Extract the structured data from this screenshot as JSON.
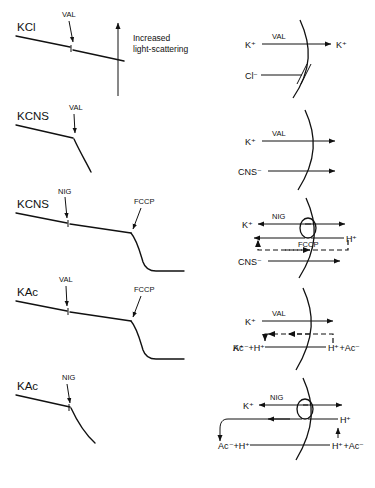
{
  "figure": {
    "axis_label_line1": "Increased",
    "axis_label_line2": "light-scattering",
    "caption": ""
  },
  "traces": [
    {
      "id": "trace-kcl",
      "salt_label": "KCl",
      "additions": [
        "VAL"
      ],
      "shape": "slow linear decline, small downward break at VAL then continued linear decline"
    },
    {
      "id": "trace-kcns-val",
      "salt_label": "KCNS",
      "additions": [
        "VAL"
      ],
      "shape": "linear decline then steep curved fall after VAL"
    },
    {
      "id": "trace-kcns-nig-fccp",
      "salt_label": "KCNS",
      "additions": [
        "NIG",
        "FCCP"
      ],
      "shape": "shallow decline through NIG, sharp curved drop after FCCP to a flat plateau"
    },
    {
      "id": "trace-kac-val-fccp",
      "salt_label": "KAc",
      "additions": [
        "VAL",
        "FCCP"
      ],
      "shape": "shallow decline through VAL, sharp curved drop after FCCP to a flat plateau"
    },
    {
      "id": "trace-kac-nig",
      "salt_label": "KAc",
      "additions": [
        "NIG"
      ],
      "shape": "linear decline then steep curved fall after NIG"
    }
  ],
  "diagrams": [
    {
      "id": "diagram-kcl",
      "carrier": "VAL",
      "species_left": [
        "K⁺",
        "Cl⁻"
      ],
      "species_right": [
        "K⁺"
      ],
      "blocked_species": "Cl⁻",
      "note": "K+ permeates via VAL; Cl- is blocked at the membrane"
    },
    {
      "id": "diagram-kcns",
      "carrier": "VAL",
      "species_left": [
        "K⁺",
        "CNS⁻"
      ],
      "species_right": [],
      "note": "K+ via VAL and CNS- both permeate"
    },
    {
      "id": "diagram-kcns-nig-fccp",
      "carrier": "NIG",
      "second_carrier": "FCCP",
      "species_left": [
        "K⁺",
        "CNS⁻"
      ],
      "species_right": [
        "H⁺"
      ],
      "note": "K+/H+ exchange via NIG; FCCP carries H+ back (dashed); CNS- permeates"
    },
    {
      "id": "diagram-kac-val-fccp",
      "carrier": "VAL",
      "species_left": [
        "K⁺",
        "Ac⁻+H⁺"
      ],
      "species_right": [
        "H⁺+Ac⁻"
      ],
      "note": "K+ via VAL; acetic acid permeates and dissociates (dashed return)"
    },
    {
      "id": "diagram-kac-nig",
      "carrier": "NIG",
      "species_left": [
        "K⁺",
        "Ac⁻+H⁺"
      ],
      "species_right": [
        "H⁺",
        "H⁺+Ac⁻"
      ],
      "note": "K+/H+ exchange via NIG coupled to acetate uptake"
    }
  ]
}
